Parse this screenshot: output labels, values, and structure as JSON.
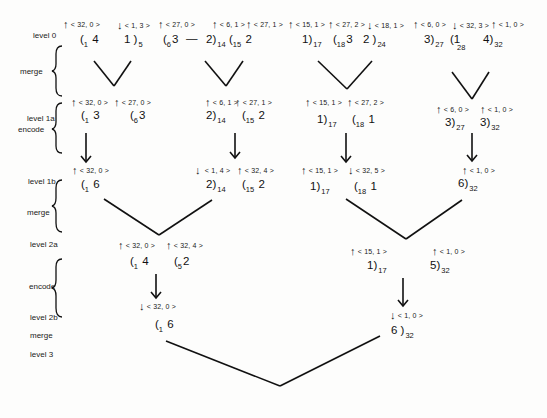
{
  "diagram": {
    "type": "merge-encode-tree",
    "level_labels": {
      "level0": "level 0",
      "merge1": "merge",
      "level1a": "level 1a",
      "encode1": "encode",
      "level1b": "level 1b",
      "merge2": "merge",
      "level2a": "level 2a",
      "encode2": "encode",
      "level2b": "level 2b",
      "merge3": "merge",
      "level3": "level 3"
    },
    "level0": {
      "tags": [
        {
          "dir": "up",
          "text": "< 32, 0 >"
        },
        {
          "dir": "down",
          "text": "< 1, 3 >"
        },
        {
          "dir": "up",
          "text": "< 27, 0 >"
        },
        {
          "dir": "up",
          "text": "< 6, 1 >"
        },
        {
          "dir": "up",
          "text": "< 27, 1 >"
        },
        {
          "dir": "up",
          "text": "< 15, 1 >"
        },
        {
          "dir": "up",
          "text": "< 27, 2 >"
        },
        {
          "dir": "down",
          "text": "< 18, 1 >"
        },
        {
          "dir": "up",
          "text": "< 6, 0 >"
        },
        {
          "dir": "down",
          "text": "< 32, 3 >"
        },
        {
          "dir": "up",
          "text": "< 1, 0 >"
        }
      ],
      "tokens": [
        {
          "pre": "1",
          "open": "(",
          "val": "4",
          "close": "",
          "sub": ""
        },
        {
          "pre": "",
          "open": "",
          "val": "1",
          "close": ")",
          "sub": "5"
        },
        {
          "pre": "6",
          "open": "(",
          "val": "3",
          "close": "",
          "sub": ""
        },
        {
          "pre": "",
          "open": "",
          "val": "—",
          "close": "",
          "sub": ""
        },
        {
          "pre": "",
          "open": "",
          "val": "2",
          "close": ")",
          "sub": "14"
        },
        {
          "pre": "15",
          "open": "(",
          "val": "2",
          "close": "",
          "sub": ""
        },
        {
          "pre": "",
          "open": "",
          "val": "1",
          "close": ")",
          "sub": "17"
        },
        {
          "pre": "18",
          "open": "(",
          "val": "3",
          "close": "",
          "sub": ""
        },
        {
          "pre": "",
          "open": "",
          "val": "2",
          "close": ")",
          "sub": "24"
        },
        {
          "pre": "",
          "open": "",
          "val": "3",
          "close": ")",
          "sub": "27"
        },
        {
          "pre": "28",
          "open": "(",
          "val": "1",
          "close": "",
          "sub": ""
        },
        {
          "pre": "",
          "open": "",
          "val": "4",
          "close": ")",
          "sub": "32"
        }
      ]
    },
    "level1a": {
      "tags": [
        {
          "dir": "up",
          "text": "< 32, 0 >"
        },
        {
          "dir": "up",
          "text": "< 27, 0 >"
        },
        {
          "dir": "up",
          "text": "< 6, 1 >"
        },
        {
          "dir": "up",
          "text": "< 27, 1 >"
        },
        {
          "dir": "up",
          "text": "< 15, 1 >"
        },
        {
          "dir": "up",
          "text": "< 27, 2 >"
        },
        {
          "dir": "up",
          "text": "< 6, 0 >"
        },
        {
          "dir": "up",
          "text": "< 1, 0 >"
        }
      ],
      "tokens": [
        {
          "pre": "1",
          "val": "3",
          "sub": ""
        },
        {
          "pre": "6",
          "val": "3",
          "sub": ""
        },
        {
          "pre": "",
          "val": "2",
          "sub": "14"
        },
        {
          "pre": "15",
          "val": "2",
          "sub": ""
        },
        {
          "pre": "",
          "val": "1",
          "sub": "17"
        },
        {
          "pre": "18",
          "val": "1",
          "sub": ""
        },
        {
          "pre": "",
          "val": "3",
          "sub": "27"
        },
        {
          "pre": "",
          "val": "3",
          "sub": "32"
        }
      ]
    },
    "level1b": {
      "tags": [
        {
          "dir": "up",
          "text": "< 32, 0 >"
        },
        {
          "dir": "down",
          "text": "< 1, 4 >"
        },
        {
          "dir": "up",
          "text": "< 32, 4 >"
        },
        {
          "dir": "up",
          "text": "< 15, 1 >"
        },
        {
          "dir": "down",
          "text": "< 32, 5 >"
        },
        {
          "dir": "up",
          "text": "< 1, 0 >"
        }
      ],
      "tokens": [
        {
          "pre": "1",
          "val": "6",
          "sub": ""
        },
        {
          "pre": "",
          "val": "2",
          "sub": "14"
        },
        {
          "pre": "15",
          "val": "2",
          "sub": ""
        },
        {
          "pre": "",
          "val": "1",
          "sub": "17"
        },
        {
          "pre": "18",
          "val": "1",
          "sub": ""
        },
        {
          "pre": "",
          "val": "6",
          "sub": "32"
        }
      ]
    },
    "level2a": {
      "tags": [
        {
          "dir": "up",
          "text": "< 32, 0 >"
        },
        {
          "dir": "up",
          "text": "< 32, 4 >"
        },
        {
          "dir": "up",
          "text": "< 15, 1 >"
        },
        {
          "dir": "up",
          "text": "< 1, 0 >"
        }
      ],
      "tokens": [
        {
          "pre": "1",
          "val": "4",
          "sub": ""
        },
        {
          "pre": "5",
          "val": "2",
          "sub": ""
        },
        {
          "pre": "",
          "val": "1",
          "sub": "17"
        },
        {
          "pre": "",
          "val": "5",
          "sub": "32"
        }
      ]
    },
    "level2b": {
      "tags": [
        {
          "dir": "down",
          "text": "< 32, 0 >"
        },
        {
          "dir": "down",
          "text": "< 1, 0 >"
        }
      ],
      "tokens": [
        {
          "pre": "1",
          "val": "6",
          "sub": ""
        },
        {
          "pre": "",
          "val": "6",
          "sub": "32"
        }
      ]
    },
    "icons": {
      "up": "↑",
      "down": "↓",
      "brace": "left-curly-brace"
    }
  }
}
